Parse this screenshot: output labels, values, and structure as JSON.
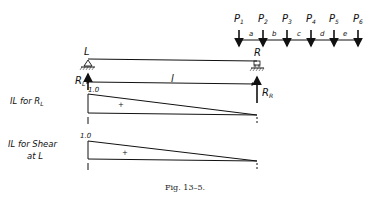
{
  "figure": {
    "caption": "Fig. 13–5.",
    "loads": [
      {
        "name": "P",
        "sub": "1"
      },
      {
        "name": "P",
        "sub": "2"
      },
      {
        "name": "P",
        "sub": "3"
      },
      {
        "name": "P",
        "sub": "4"
      },
      {
        "name": "P",
        "sub": "5"
      },
      {
        "name": "P",
        "sub": "6"
      }
    ],
    "spacings": [
      "a",
      "b",
      "c",
      "d",
      "e"
    ],
    "beam": {
      "left_label": "L",
      "right_label": "R",
      "span_label": "l",
      "left_reaction": {
        "name": "R",
        "sub": "L"
      },
      "right_reaction": {
        "name": "R",
        "sub": "R"
      }
    },
    "influence_lines": [
      {
        "label_lines": [
          "IL for R"
        ],
        "label_sub": "L",
        "ordinate_label": "1.0",
        "sign": "+"
      },
      {
        "label_lines": [
          "IL for Shear",
          "at L"
        ],
        "label_sub": "",
        "ordinate_label": "1.0",
        "sign": "+"
      }
    ]
  }
}
